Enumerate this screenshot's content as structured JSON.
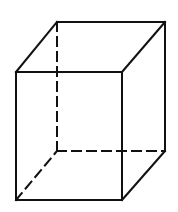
{
  "diagram": {
    "title": "",
    "type": "cuboid-wireframe",
    "stroke_color": "#111111",
    "background_color": "#ffffff",
    "vertices": {
      "front_top_left": [
        16,
        72
      ],
      "front_top_right": [
        122,
        72
      ],
      "front_bottom_left": [
        16,
        200
      ],
      "front_bottom_right": [
        122,
        200
      ],
      "back_top_left": [
        57,
        22
      ],
      "back_top_right": [
        165,
        22
      ],
      "back_bottom_left": [
        57,
        151
      ],
      "back_bottom_right": [
        165,
        151
      ]
    },
    "solid_edges": [
      [
        "front_top_left",
        "front_top_right"
      ],
      [
        "front_top_right",
        "front_bottom_right"
      ],
      [
        "front_bottom_right",
        "front_bottom_left"
      ],
      [
        "front_bottom_left",
        "front_top_left"
      ],
      [
        "back_top_left",
        "back_top_right"
      ],
      [
        "back_top_right",
        "back_bottom_right"
      ],
      [
        "front_top_left",
        "back_top_left"
      ],
      [
        "front_top_right",
        "back_top_right"
      ],
      [
        "front_bottom_right",
        "back_bottom_right"
      ]
    ],
    "hidden_edges": [
      [
        "back_top_left",
        "back_bottom_left"
      ],
      [
        "back_bottom_left",
        "back_bottom_right"
      ],
      [
        "front_bottom_left",
        "back_bottom_left"
      ]
    ]
  }
}
